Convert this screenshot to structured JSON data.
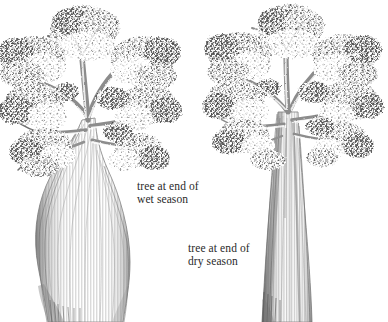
{
  "figure": {
    "kind": "botanical-illustration",
    "medium": "pencil-drawing",
    "background_color": "#ffffff",
    "width": 388,
    "height": 322
  },
  "captions": {
    "wet": {
      "line1": "tree at end of",
      "line2": "wet season"
    },
    "dry": {
      "line1": "tree at end of",
      "line2": "dry season"
    }
  },
  "colors": {
    "ink_dark": "#4a4a4a",
    "ink_mid": "#7d7d7d",
    "ink_light": "#a8a8a8",
    "ink_faint": "#c9c9c9",
    "paper": "#ffffff",
    "text": "#2a2a2a"
  },
  "trees": [
    {
      "id": "tree-wet-season",
      "name": "tree at end of wet season",
      "trunk_shape": "swollen bottle-shaped, water-engorged",
      "trunk_base_x": [
        48,
        123
      ],
      "trunk_widest_y": 230,
      "canopy_top_y": 5,
      "canopy_span_x": [
        2,
        178
      ],
      "center_x": 88
    },
    {
      "id": "tree-dry-season",
      "name": "tree at end of dry season",
      "trunk_shape": "slender columnar, water-depleted",
      "trunk_base_x": [
        262,
        312
      ],
      "trunk_widest_y": 300,
      "canopy_top_y": 8,
      "canopy_span_x": [
        205,
        386
      ],
      "center_x": 292
    }
  ]
}
